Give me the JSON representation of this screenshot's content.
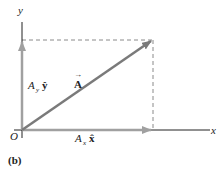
{
  "diagram": {
    "panel_label": "(b)",
    "axes": {
      "x_label": "x",
      "y_label": "y",
      "origin_label": "O"
    },
    "vector": {
      "name": "A",
      "arrow_accent": "→",
      "color": "#7a7a7a"
    },
    "components": {
      "x": {
        "coef": "A",
        "sub": "x",
        "unit": "x̂"
      },
      "y": {
        "coef": "A",
        "sub": "y",
        "unit": "ŷ"
      },
      "color": "#9a9a9a"
    },
    "colors": {
      "axis": "#222222",
      "dashed": "#8a8a8a",
      "vector": "#7a7a7a",
      "component": "#a0a0a0"
    }
  }
}
